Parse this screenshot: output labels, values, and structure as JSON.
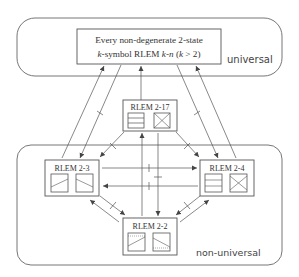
{
  "regions": {
    "universal": {
      "label": "universal"
    },
    "non_universal": {
      "label": "non-universal"
    }
  },
  "top_box": {
    "line1": "Every non-degenerate 2-state",
    "line2_prefix": "k",
    "line2_mid": "-symbol RLEM ",
    "line2_k": "k",
    "line2_dash": "-",
    "line2_n": "n",
    "line2_cond_open": " (",
    "line2_cond_k": "k",
    "line2_cond_rest": " > 2)"
  },
  "nodes": [
    {
      "id": "rlem-2-17",
      "label": "RLEM 2-17"
    },
    {
      "id": "rlem-2-3",
      "label": "RLEM 2-3"
    },
    {
      "id": "rlem-2-4",
      "label": "RLEM 2-4"
    },
    {
      "id": "rlem-2-2",
      "label": "RLEM 2-2"
    }
  ],
  "colors": {
    "line": "#555555",
    "region_border": "#666666",
    "text": "#333333"
  }
}
